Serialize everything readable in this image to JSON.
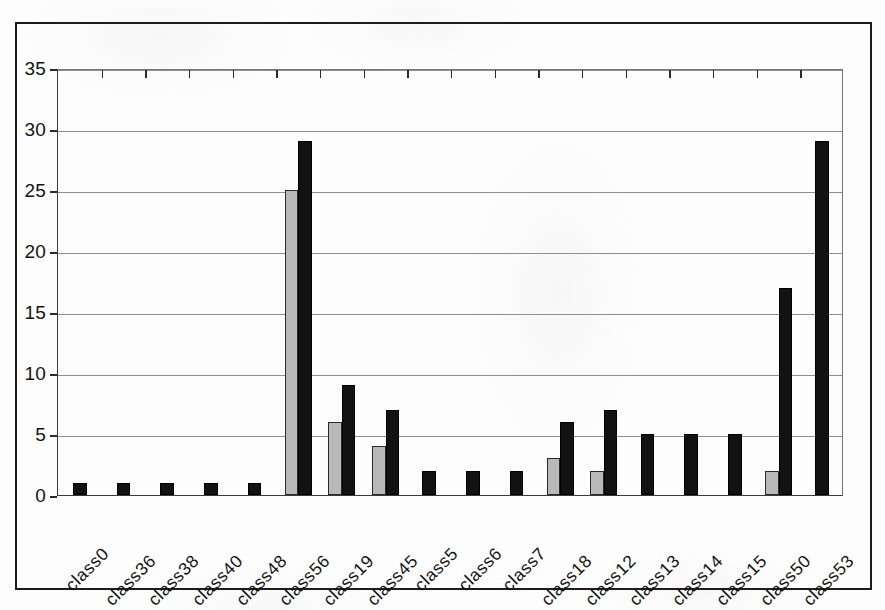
{
  "chart_data": {
    "type": "bar",
    "title": "",
    "xlabel": "",
    "ylabel": "",
    "ylim": [
      0,
      35
    ],
    "yticks": [
      0,
      5,
      10,
      15,
      20,
      25,
      30,
      35
    ],
    "grid": true,
    "legend": "none",
    "categories": [
      "class0",
      "class36",
      "class38",
      "class40",
      "class48",
      "class56",
      "class19",
      "class45",
      "class5",
      "class6",
      "class7",
      "class18",
      "class12",
      "class13",
      "class14",
      "class15",
      "class50",
      "class53"
    ],
    "series": [
      {
        "name": "series-a",
        "color": "#b9b9b9",
        "values": [
          0,
          0,
          0,
          0,
          0,
          25,
          6,
          4,
          0,
          0,
          0,
          3,
          2,
          0,
          0,
          0,
          2,
          0
        ]
      },
      {
        "name": "series-b",
        "color": "#121212",
        "values": [
          1,
          1,
          1,
          1,
          1,
          29,
          9,
          7,
          2,
          2,
          2,
          6,
          7,
          5,
          5,
          5,
          17,
          29
        ]
      }
    ]
  },
  "axis": {
    "ytick_labels": [
      "0",
      "5",
      "10",
      "15",
      "20",
      "25",
      "30",
      "35"
    ]
  },
  "colors": {
    "series_a": "#b9b9b9",
    "series_b": "#121212",
    "gridline": "#8e8e8e",
    "axis": "#2b2b2b",
    "frame": "#1c1c1c",
    "background": "#fdfdfd"
  }
}
